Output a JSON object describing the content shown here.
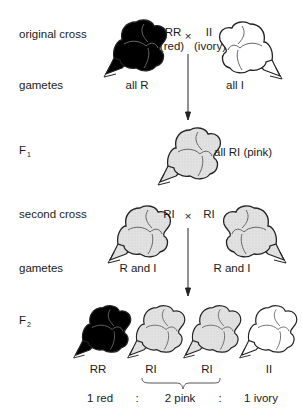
{
  "rows": {
    "original_cross": {
      "label": "original cross",
      "parent1": {
        "genotype": "RR",
        "phenotype": "(red)",
        "color": "red"
      },
      "cross_symbol": "×",
      "parent2": {
        "genotype": "II",
        "phenotype": "(ivory)",
        "color": "ivory"
      }
    },
    "gametes1": {
      "label": "gametes",
      "left": "all R",
      "right": "all I"
    },
    "f1": {
      "label": "F",
      "subscript": "1",
      "text": "all RI (pink)"
    },
    "second_cross": {
      "label": "second cross",
      "parent1": {
        "genotype": "RI"
      },
      "cross_symbol": "×",
      "parent2": {
        "genotype": "RI"
      }
    },
    "gametes2": {
      "label": "gametes",
      "left": "R and I",
      "right": "R and I"
    },
    "f2": {
      "label": "F",
      "subscript": "2",
      "offspring": [
        {
          "genotype": "RR",
          "color": "red"
        },
        {
          "genotype": "RI",
          "color": "pink"
        },
        {
          "genotype": "RI",
          "color": "pink"
        },
        {
          "genotype": "II",
          "color": "ivory"
        }
      ],
      "ratio": {
        "red": "1 red",
        "sep1": ":",
        "pink": "2 pink",
        "sep2": ":",
        "ivory": "1 ivory"
      }
    }
  },
  "colors": {
    "red_fill": "#000000",
    "pink_fill": "#dcdcdc",
    "ivory_fill": "#ffffff",
    "outline": "#2a2a2a"
  }
}
